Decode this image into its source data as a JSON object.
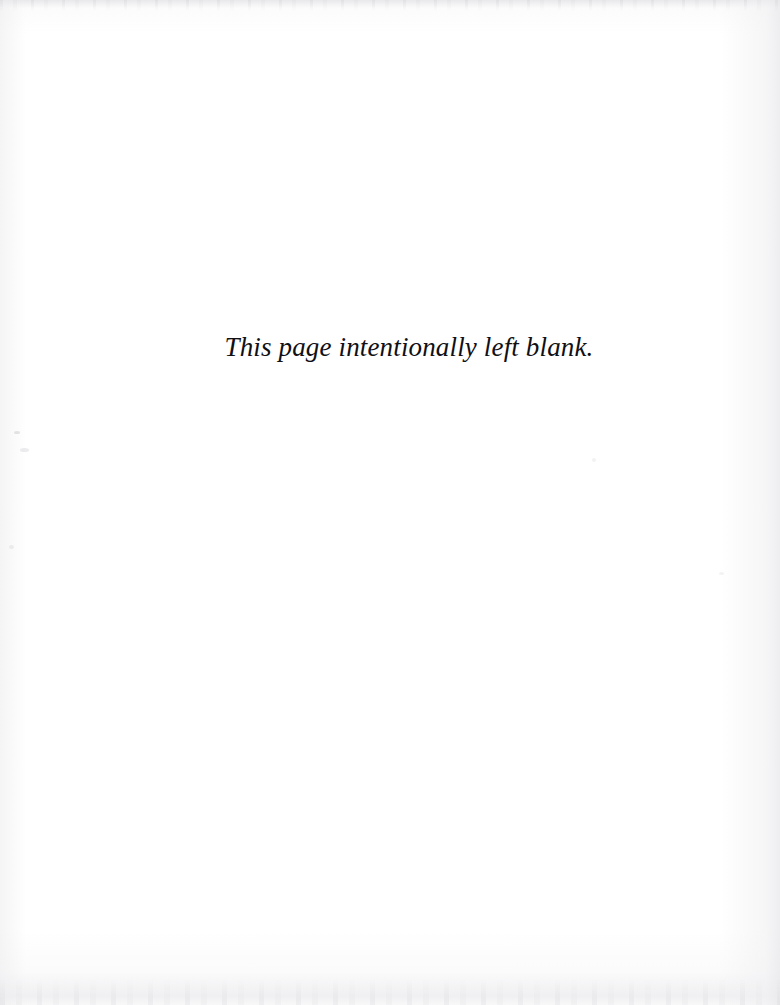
{
  "document": {
    "type": "scanned-book-page",
    "page_kind": "intentionally-blank-filler-page",
    "background_color": "#ffffff",
    "ink_color": "#111014"
  },
  "content": {
    "notice_text": "This page intentionally left blank."
  },
  "artifacts": {
    "top_scan_edge": "",
    "bottom_scan_edge": "",
    "right_scan_edge": "",
    "specks": [
      "",
      "",
      "",
      "",
      ""
    ]
  }
}
